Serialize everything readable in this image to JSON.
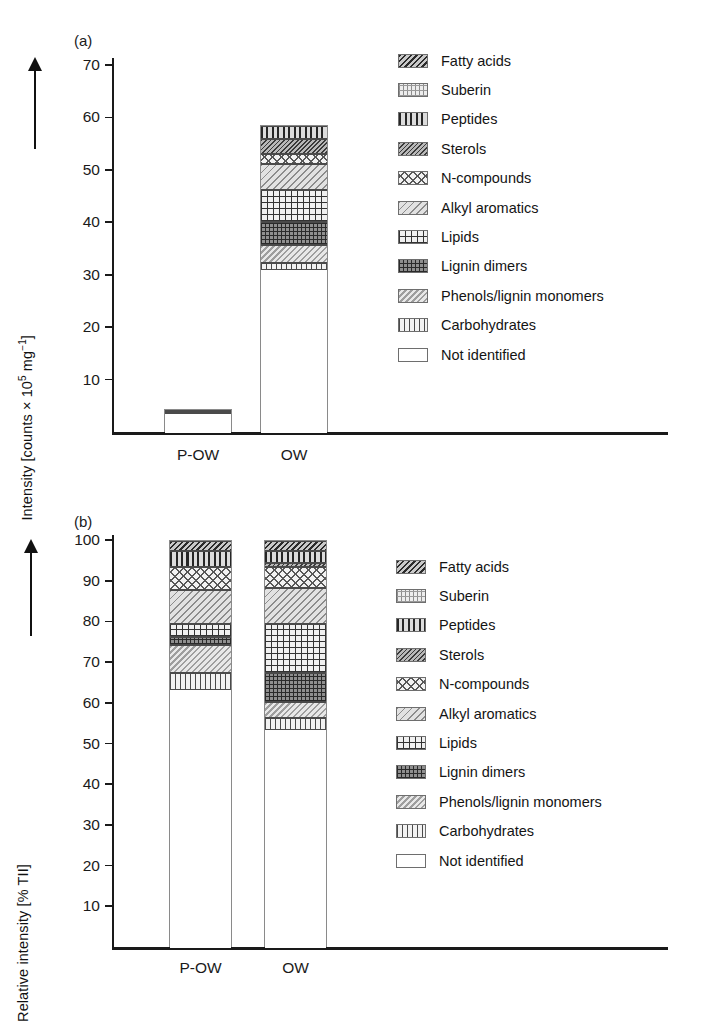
{
  "figure": {
    "panel_a_tag": "(a)",
    "panel_b_tag": "(b)"
  },
  "panel_a": {
    "ylabel_prefix": "Intensity [counts × 10",
    "ylabel_exp": "5",
    "ylabel_mid": " mg",
    "ylabel_exp2": "−1",
    "ylabel_suffix": "]",
    "ylabel_full": "Intensity [counts × 10⁵ mg⁻¹]",
    "yticks": [
      "70",
      "60",
      "50",
      "40",
      "30",
      "20",
      "10"
    ],
    "categories": [
      "P-OW",
      "OW"
    ]
  },
  "panel_b": {
    "ylabel_full": "Relative intensity [% TII]",
    "yticks": [
      "100",
      "90",
      "80",
      "70",
      "60",
      "50",
      "40",
      "30",
      "20",
      "10"
    ],
    "categories": [
      "P-OW",
      "OW"
    ]
  },
  "legend": {
    "items": [
      {
        "label": "Fatty acids",
        "pattern": "p-fatty",
        "swatch_name": "swatch-fatty-acids"
      },
      {
        "label": "Suberin",
        "pattern": "p-suberin",
        "swatch_name": "swatch-suberin"
      },
      {
        "label": "Peptides",
        "pattern": "p-peptides",
        "swatch_name": "swatch-peptides"
      },
      {
        "label": "Sterols",
        "pattern": "p-sterols",
        "swatch_name": "swatch-sterols"
      },
      {
        "label": "N-compounds",
        "pattern": "p-ncomp",
        "swatch_name": "swatch-n-compounds"
      },
      {
        "label": "Alkyl aromatics",
        "pattern": "p-alkyl",
        "swatch_name": "swatch-alkyl-aromatics"
      },
      {
        "label": "Lipids",
        "pattern": "p-lipids",
        "swatch_name": "swatch-lipids"
      },
      {
        "label": "Lignin dimers",
        "pattern": "p-lignind",
        "swatch_name": "swatch-lignin-dimers"
      },
      {
        "label": "Phenols/lignin monomers",
        "pattern": "p-phenols",
        "swatch_name": "swatch-phenols-lignin-monomers"
      },
      {
        "label": "Carbohydrates",
        "pattern": "p-carb",
        "swatch_name": "swatch-carbohydrates"
      },
      {
        "label": "Not identified",
        "pattern": "p-notid",
        "swatch_name": "swatch-not-identified"
      }
    ]
  },
  "chart_data": [
    {
      "type": "bar",
      "id": "panel-a",
      "title": "(a)",
      "stacked": true,
      "xlabel": "",
      "ylabel": "Intensity [counts × 10⁵ mg⁻¹]",
      "ylim": [
        0,
        70
      ],
      "ytick_step": 10,
      "grid": false,
      "legend_position": "right",
      "categories": [
        "P-OW",
        "OW"
      ],
      "series": [
        {
          "name": "Not identified",
          "values": [
            3.7,
            31.0
          ]
        },
        {
          "name": "Carbohydrates",
          "values": [
            0.3,
            1.5
          ]
        },
        {
          "name": "Phenols/lignin monomers",
          "values": [
            0.1,
            3.3
          ]
        },
        {
          "name": "Lignin dimers",
          "values": [
            0.05,
            4.5
          ]
        },
        {
          "name": "Lipids",
          "values": [
            0.05,
            6.0
          ]
        },
        {
          "name": "Alkyl aromatics",
          "values": [
            0.05,
            5.0
          ]
        },
        {
          "name": "N-compounds",
          "values": [
            0.03,
            2.0
          ]
        },
        {
          "name": "Sterols",
          "values": [
            0.02,
            2.7
          ]
        },
        {
          "name": "Peptides",
          "values": [
            0.0,
            2.5
          ]
        },
        {
          "name": "Suberin",
          "values": [
            0.0,
            0.0
          ]
        },
        {
          "name": "Fatty acids",
          "values": [
            0.0,
            0.0
          ]
        }
      ],
      "totals": [
        4.3,
        58.5
      ]
    },
    {
      "type": "bar",
      "id": "panel-b",
      "title": "(b)",
      "stacked": true,
      "xlabel": "",
      "ylabel": "Relative intensity [% TII]",
      "ylim": [
        0,
        100
      ],
      "ytick_step": 10,
      "grid": false,
      "legend_position": "right",
      "categories": [
        "P-OW",
        "OW"
      ],
      "series": [
        {
          "name": "Not identified",
          "values": [
            63.5,
            53.5
          ]
        },
        {
          "name": "Carbohydrates",
          "values": [
            4.0,
            3.0
          ]
        },
        {
          "name": "Phenols/lignin monomers",
          "values": [
            7.0,
            4.0
          ]
        },
        {
          "name": "Lignin dimers",
          "values": [
            2.0,
            7.0
          ]
        },
        {
          "name": "Lipids",
          "values": [
            3.0,
            12.0
          ]
        },
        {
          "name": "Alkyl aromatics",
          "values": [
            8.5,
            9.0
          ]
        },
        {
          "name": "N-compounds",
          "values": [
            5.5,
            5.0
          ]
        },
        {
          "name": "Sterols",
          "values": [
            0.0,
            1.0
          ]
        },
        {
          "name": "Peptides",
          "values": [
            4.0,
            3.0
          ]
        },
        {
          "name": "Suberin",
          "values": [
            0.0,
            0.0
          ]
        },
        {
          "name": "Fatty acids",
          "values": [
            2.5,
            2.5
          ]
        }
      ],
      "totals": [
        100.0,
        100.0
      ]
    }
  ]
}
